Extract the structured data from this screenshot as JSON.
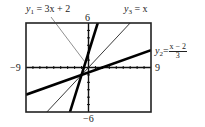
{
  "chart_data": {
    "type": "line",
    "title": "",
    "xlabel": "",
    "ylabel": "",
    "window": {
      "xmin": -9,
      "xmax": 9,
      "ymin": -6,
      "ymax": 6,
      "xscl": 1,
      "yscl": 1
    },
    "xlim": [
      -9,
      9
    ],
    "ylim": [
      -6,
      6
    ],
    "grid": false,
    "tick_labels": {
      "xmin": "−9",
      "xmax": "9",
      "ymax": "6",
      "ymin": "−6"
    },
    "series": [
      {
        "name": "y1",
        "label_var": "y",
        "label_sub": "1",
        "label_rhs": "= 3x + 2",
        "expression": "3x + 2",
        "slope": 3,
        "intercept": 2,
        "style": "thick",
        "x": [
          -9,
          9
        ],
        "y": [
          -25,
          29
        ]
      },
      {
        "name": "y2",
        "label_var": "y",
        "label_sub": "2",
        "label_eq": "=",
        "label_num": "x − 2",
        "label_den": "3",
        "expression": "(x - 2)/3",
        "slope": 0.3333,
        "intercept": -0.6667,
        "style": "thick",
        "x": [
          -9,
          9
        ],
        "y": [
          -3.667,
          2.333
        ]
      },
      {
        "name": "y3",
        "label_var": "y",
        "label_sub": "3",
        "label_rhs": "= x",
        "expression": "x",
        "slope": 1,
        "intercept": 0,
        "style": "thin",
        "x": [
          -9,
          9
        ],
        "y": [
          -9,
          9
        ]
      }
    ],
    "annotations": [
      "y1 = 3x + 2",
      "y2 = (x − 2)/3",
      "y3 = x"
    ]
  }
}
